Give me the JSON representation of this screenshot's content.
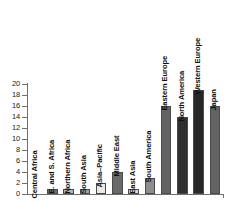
{
  "chart_data": {
    "type": "bar",
    "title": "",
    "xlabel": "",
    "ylabel": "",
    "ylim": [
      0,
      20
    ],
    "ytick_step": 2,
    "grid": false,
    "legend": "none",
    "categories": [
      "Central Africa",
      "E. and S. Africa",
      "Northern Africa",
      "South Asia",
      "Asia–Pacific",
      "Middle East",
      "East Asia",
      "South America",
      "Eastern Europe",
      "North America",
      "Western Europe",
      "Japan"
    ],
    "values": [
      0,
      1,
      1,
      1,
      2,
      4,
      1,
      3,
      16,
      14,
      19,
      16
    ],
    "bar_colors": [
      "#9a9a9a",
      "#6e6e6e",
      "#b4b4b4",
      "#a8a8a8",
      "#e9e9e9",
      "#6a6a6a",
      "#dcdcdc",
      "#8d8d8d",
      "#636363",
      "#2f2f2f",
      "#272727",
      "#636363"
    ],
    "ytick_labels": [
      "0",
      "2",
      "4",
      "6",
      "8",
      "10",
      "12",
      "14",
      "16",
      "18",
      "20"
    ],
    "ytick_values": [
      0,
      2,
      4,
      6,
      8,
      10,
      12,
      14,
      16,
      18,
      20
    ],
    "axis_color": "#6f6f6f",
    "bar_edge_color": "#4a4a4a",
    "background": "#ffffff",
    "label_color": "#101010"
  }
}
